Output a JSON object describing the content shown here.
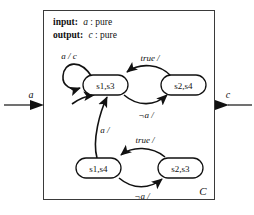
{
  "diagram": {
    "title": "C",
    "box_label": "C",
    "header": {
      "input_label": "input:",
      "input_signal": "a",
      "input_type": ": pure",
      "output_label": "output:",
      "output_signal": "c",
      "output_type": ": pure"
    },
    "ports": {
      "input_port": "a",
      "output_port": "c"
    },
    "states": [
      {
        "id": "s1s3",
        "label": "s1,s3",
        "cx": 105,
        "cy": 85
      },
      {
        "id": "s2s4",
        "label": "s2,s4",
        "cx": 183,
        "cy": 85
      },
      {
        "id": "s1s4",
        "label": "s1,s4",
        "cx": 98,
        "cy": 168
      },
      {
        "id": "s2s3",
        "label": "s2,s3",
        "cx": 180,
        "cy": 168
      }
    ],
    "transitions": [
      {
        "id": "t-self",
        "from": "s1s3",
        "to": "s1s3",
        "guard": "a",
        "action": "c",
        "label": "a / c"
      },
      {
        "id": "t-top-back",
        "from": "s2s4",
        "to": "s1s3",
        "guard": "true",
        "action": "",
        "label": "true /"
      },
      {
        "id": "t-top-fwd",
        "from": "s1s3",
        "to": "s2s4",
        "guard": "¬a",
        "action": "",
        "label": "¬a /"
      },
      {
        "id": "t-up",
        "from": "s1s4",
        "to": "s1s3",
        "guard": "a",
        "action": "",
        "label": "a /"
      },
      {
        "id": "t-bot-back",
        "from": "s2s3",
        "to": "s1s4",
        "guard": "true",
        "action": "",
        "label": "true /"
      },
      {
        "id": "t-bot-fwd",
        "from": "s1s4",
        "to": "s2s3",
        "guard": "¬a",
        "action": "",
        "label": "¬a /"
      }
    ],
    "colors": {
      "stroke": "#111111",
      "box_stroke": "#3a3a3a",
      "background": "#ffffff"
    }
  }
}
